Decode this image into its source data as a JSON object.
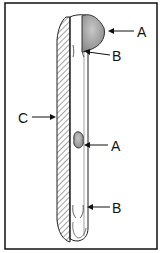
{
  "diagram": {
    "labels": {
      "a_top": "A",
      "b_top": "B",
      "c": "C",
      "a_mid": "A",
      "b_bottom": "B"
    },
    "colors": {
      "border": "#111111",
      "line": "#222222",
      "deposit_fill": "#a9a9a9",
      "background": "#ffffff"
    }
  }
}
